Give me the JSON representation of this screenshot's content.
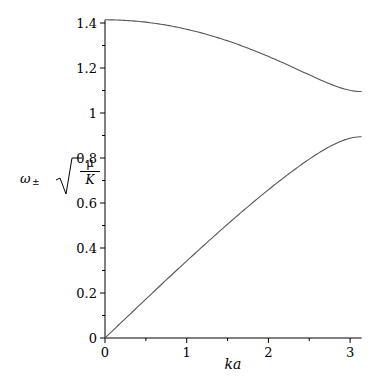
{
  "chart_data": {
    "type": "line",
    "title": "",
    "xlabel": "ka",
    "ylabel": "ω± √(μ/K)",
    "ylabel_parts": {
      "omega": "ω",
      "sub": "±",
      "num": "μ",
      "den": "K"
    },
    "xlim": [
      0,
      3.1416
    ],
    "ylim": [
      0,
      1.414
    ],
    "xticks": [
      "0",
      "1",
      "2",
      "3"
    ],
    "yticks": [
      "0",
      "0.2",
      "0.4",
      "0.6",
      "0.8",
      "1",
      "1.2",
      "1.4"
    ],
    "grid": false,
    "legend": null,
    "x": [
      0,
      0.25,
      0.5,
      0.75,
      1.0,
      1.25,
      1.5,
      1.75,
      2.0,
      2.25,
      2.5,
      2.75,
      3.0,
      3.1416
    ],
    "series": [
      {
        "name": "ω+ (optical branch)",
        "color": "#555555",
        "values": [
          1.4142,
          1.4116,
          1.4036,
          1.3905,
          1.3722,
          1.3488,
          1.3207,
          1.288,
          1.2514,
          1.2114,
          1.1696,
          1.1298,
          1.1008,
          1.0954
        ]
      },
      {
        "name": "ω− (acoustic branch)",
        "color": "#555555",
        "values": [
          0,
          0.0866,
          0.1727,
          0.2581,
          0.3423,
          0.425,
          0.5057,
          0.5838,
          0.6589,
          0.7298,
          0.795,
          0.8507,
          0.8879,
          0.8944
        ]
      }
    ]
  }
}
